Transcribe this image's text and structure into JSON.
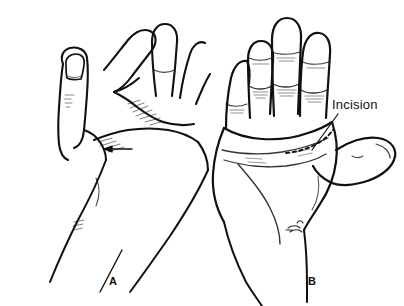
{
  "figure": {
    "background_color": "#ffffff",
    "ink_color": "#111111",
    "width": 404,
    "height": 306
  },
  "annotations": {
    "incision_label": "Incision",
    "panel_a_label": "A",
    "panel_b_label": "B"
  },
  "panels": [
    {
      "id": "A",
      "label": "A",
      "view": "lateral/radial view of hand with flexed fingers and extended thumb, forearm descending to lower left"
    },
    {
      "id": "B",
      "label": "B",
      "view": "palmar view of hand with fingers extended and thumb abducted to the right, showing palmar creases and dashed incision line"
    }
  ],
  "markings": {
    "incision_line_style": "dashed",
    "incision_location": "distal palmar crease of palm in panel B",
    "leader_line": "diagonal line from Incision label down-left to dashed incision marking",
    "arrow_panel_a": "arrow indicating palmar crease region in panel A",
    "artist_signature": "small script signature near ulnar wrist of panel B"
  }
}
